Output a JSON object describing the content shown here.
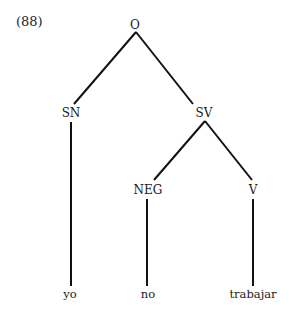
{
  "example_number": "(88)",
  "tree": {
    "root": {
      "label": "O"
    },
    "nodes": [
      {
        "id": "sn",
        "label": "SN",
        "parent": "root"
      },
      {
        "id": "sv",
        "label": "SV",
        "parent": "root"
      },
      {
        "id": "neg",
        "label": "NEG",
        "parent": "sv"
      },
      {
        "id": "v",
        "label": "V",
        "parent": "sv"
      }
    ],
    "terminals": [
      {
        "label": "yo",
        "parent": "sn"
      },
      {
        "label": "no",
        "parent": "neg"
      },
      {
        "label": "trabajar",
        "parent": "v"
      }
    ]
  },
  "colors": {
    "line": "#111111",
    "text": "#1a1a1a",
    "background": "#ffffff"
  }
}
